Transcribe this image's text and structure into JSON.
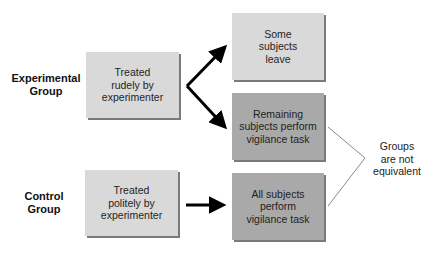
{
  "diagram": {
    "groups": [
      {
        "label": "Experimental\nGroup",
        "treatment": "Treated\nrudely by\nexperimenter"
      },
      {
        "label": "Control\nGroup",
        "treatment": "Treated\npolitely by\nexperimenter"
      }
    ],
    "outcomes": [
      {
        "text": "Some\nsubjects\nleave",
        "shade": "light"
      },
      {
        "text": "Remaining\nsubjects perform\nvigilance task",
        "shade": "dark"
      },
      {
        "text": "All subjects\nperform\nvigilance task",
        "shade": "dark"
      }
    ],
    "bracket_note": "Groups\nare not\nequivalent",
    "colors": {
      "light_box": "#d9d9d9",
      "dark_box": "#a9a9a9",
      "shadow": "#7a7a7a",
      "arrow": "#000000",
      "bracket_line": "#8a8a8a"
    }
  }
}
